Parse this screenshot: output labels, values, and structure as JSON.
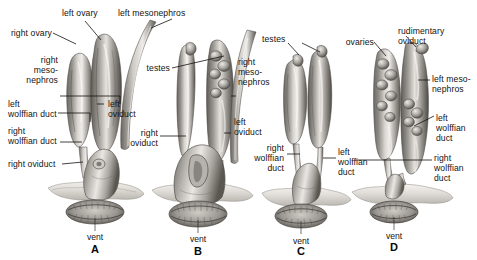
{
  "figure": {
    "type": "anatomical-illustration",
    "background_color": "#ffffff",
    "text_color": "#15130f"
  },
  "panels": [
    {
      "id": "A",
      "letter": "A",
      "vent_label": "vent",
      "labels": [
        {
          "key": "left_ovary",
          "text": "left ovary"
        },
        {
          "key": "right_ovary",
          "text": "right ovary"
        },
        {
          "key": "right_mesonephros",
          "text": "right\nmeso-\nnephros"
        },
        {
          "key": "left_wolffian_duct",
          "text": "left\nwolffian duct"
        },
        {
          "key": "right_wolffian_duct",
          "text": "right\nwolffian duct"
        },
        {
          "key": "right_oviduct",
          "text": "right oviduct"
        },
        {
          "key": "left_oviduct",
          "text": "left\noviduct"
        },
        {
          "key": "left_mesonephros",
          "text": "left mesonephros"
        }
      ]
    },
    {
      "id": "B",
      "letter": "B",
      "vent_label": "vent",
      "labels": [
        {
          "key": "testes",
          "text": "testes"
        },
        {
          "key": "right_mesonephros",
          "text": "right\nmeso-\nnephros"
        },
        {
          "key": "left_oviduct",
          "text": "left\noviduct"
        },
        {
          "key": "right_oviduct",
          "text": "right\noviduct"
        }
      ]
    },
    {
      "id": "C",
      "letter": "C",
      "vent_label": "vent",
      "labels": [
        {
          "key": "testes",
          "text": "testes"
        },
        {
          "key": "right_wolffian_duct",
          "text": "right\nwolffian\nduct"
        },
        {
          "key": "left_wolffian_duct",
          "text": "left\nwolffian\nduct"
        }
      ]
    },
    {
      "id": "D",
      "letter": "D",
      "vent_label": "vent",
      "labels": [
        {
          "key": "ovaries",
          "text": "ovaries"
        },
        {
          "key": "rudimentary_oviduct",
          "text": "rudimentary\noviduct"
        },
        {
          "key": "left_mesonephros",
          "text": "left meso-\nnephros"
        },
        {
          "key": "left_wolffian_duct",
          "text": "left\nwolffian\nduct"
        },
        {
          "key": "right_wolffian_duct",
          "text": "right\nwolffian\nduct"
        }
      ]
    }
  ]
}
